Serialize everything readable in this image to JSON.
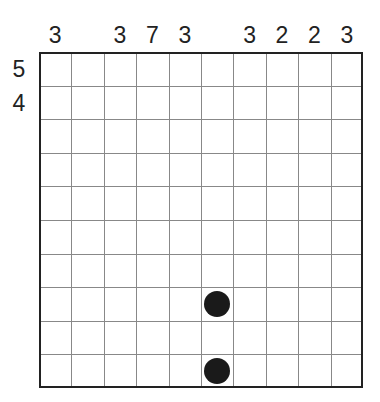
{
  "puzzle": {
    "columns": 10,
    "rows": 10,
    "column_clues": [
      "3",
      "",
      "3",
      "7",
      "3",
      "",
      "3",
      "2",
      "2",
      "3"
    ],
    "row_clues": [
      "5",
      "4",
      "",
      "",
      "",
      "",
      "",
      "",
      "",
      ""
    ],
    "dots": [
      {
        "row": 7,
        "col": 5
      },
      {
        "row": 9,
        "col": 5
      }
    ]
  }
}
